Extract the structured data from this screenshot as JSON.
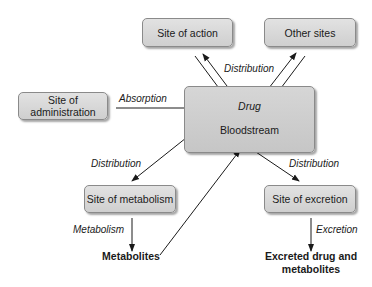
{
  "diagram": {
    "nodes": {
      "site_of_action": "Site of action",
      "other_sites": "Other sites",
      "site_of_administration_l1": "Site of",
      "site_of_administration_l2": "administration",
      "drug": "Drug",
      "bloodstream": "Bloodstream",
      "site_of_metabolism": "Site of metabolism",
      "site_of_excretion": "Site of excretion",
      "metabolites": "Metabolites",
      "excreted_l1": "Excreted drug and",
      "excreted_l2": "metabolites"
    },
    "edge_labels": {
      "distribution_top": "Distribution",
      "absorption": "Absorption",
      "distribution_left": "Distribution",
      "distribution_right": "Distribution",
      "metabolism": "Metabolism",
      "excretion": "Excretion"
    }
  }
}
